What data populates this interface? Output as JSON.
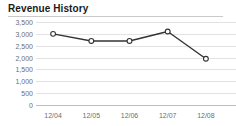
{
  "panel": {
    "title": "Revenue History",
    "background": "#ffffff",
    "rule_color": "#c9c9c9"
  },
  "chart_data": {
    "type": "line",
    "title": "Revenue History",
    "xlabel": "",
    "ylabel": "",
    "categories": [
      "12/04",
      "12/05",
      "12/06",
      "12/07",
      "12/08"
    ],
    "values": [
      3000,
      2700,
      2700,
      3100,
      1950
    ],
    "series": [
      {
        "name": "Revenue",
        "values": [
          3000,
          2700,
          2700,
          3100,
          1950
        ],
        "line_color": "#333333",
        "marker": "circle-open",
        "marker_fill": "#ffffff",
        "marker_stroke": "#333333"
      }
    ],
    "ylim": [
      0,
      3500
    ],
    "ytick_values": [
      0,
      500,
      1000,
      1500,
      2000,
      2500,
      3000,
      3500
    ],
    "ytick_labels": [
      "0",
      "500",
      "1,000",
      "1,500",
      "2,000",
      "2,500",
      "3,000",
      "3,500"
    ],
    "xtick_labels": [
      "12/04",
      "12/05",
      "12/06",
      "12/07",
      "12/08"
    ],
    "grid": true,
    "grid_color": "#e2e2e2",
    "axis_color": "#bdbdbd",
    "tick_label_color": "#6d6d6d",
    "legend": false,
    "legend_position": "none"
  }
}
